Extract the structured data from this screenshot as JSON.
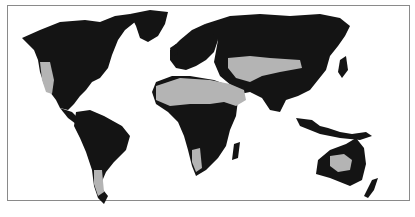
{
  "map": {
    "type": "world-map",
    "legend_visible": false,
    "colors": {
      "land": "#141414",
      "highlight_regions": "#b4b4b4",
      "ocean": "#ffffff",
      "frame": "#8a8a8a"
    },
    "highlighted_regions": [
      "western-north-america",
      "sahara-arabia",
      "central-asia",
      "southern-africa",
      "patagonia",
      "central-australia"
    ]
  }
}
